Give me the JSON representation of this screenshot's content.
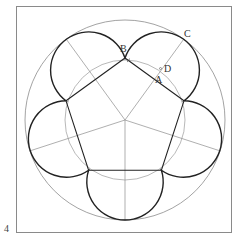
{
  "figure": {
    "number": "4",
    "frame": {
      "x": 16,
      "y": 6,
      "width": 215,
      "height": 226
    },
    "center": {
      "x": 125,
      "y": 120
    },
    "outer_circle_radius": 100,
    "inner_circle_radius": 60,
    "pentagon_circumradius": 62,
    "lobe_radius": 38.2,
    "lobe_center_distance": 61.8,
    "labels": [
      {
        "id": "B",
        "text": "B",
        "x": 120,
        "y": 52
      },
      {
        "id": "C",
        "text": "C",
        "x": 184,
        "y": 37
      },
      {
        "id": "D",
        "text": "D",
        "x": 166,
        "y": 73
      },
      {
        "id": "A",
        "text": "A",
        "x": 156,
        "y": 83
      }
    ],
    "colors": {
      "frame": "#8a8a8a",
      "thin_lines": "#8c8c8c",
      "bold_lines": "#222222",
      "labels": "#333333"
    }
  }
}
